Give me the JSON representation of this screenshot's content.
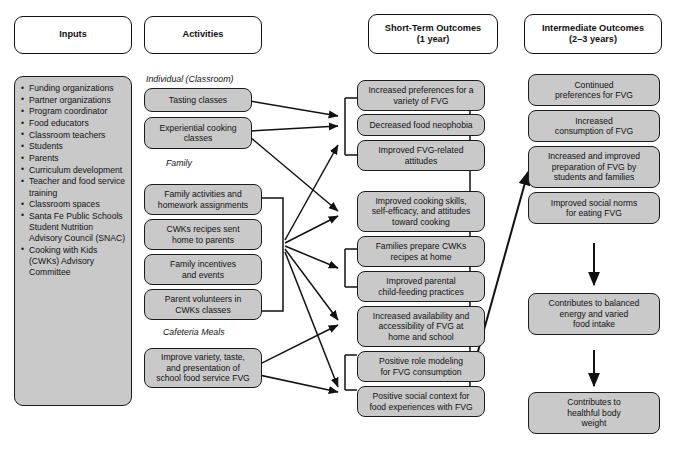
{
  "figure": {
    "type": "logic-model-diagram",
    "caption": ""
  },
  "colors": {
    "box_fill": "#c9c9c9",
    "box_border": "#1b1b1b",
    "header_fill": "#ffffff",
    "arrow": "#111111",
    "page_background": "#ffffff"
  },
  "columns": [
    {
      "key": "inputs",
      "header": "Inputs",
      "header_sub": ""
    },
    {
      "key": "activities",
      "header": "Activities",
      "header_sub": ""
    },
    {
      "key": "short_term",
      "header": "Short-Term Outcomes",
      "header_sub": "(1 year)"
    },
    {
      "key": "intermediate",
      "header": "Intermediate Outcomes",
      "header_sub": "(2–3 years)"
    }
  ],
  "inputs": {
    "items": [
      "Funding organizations",
      "Partner organizations",
      "Program coordinator",
      "Food educators",
      "Classroom teachers",
      "Students",
      "Parents",
      "Curriculum development",
      "Teacher and food service training",
      "Classroom spaces",
      "Santa Fe Public Schools Student Nutrition Advisory Council (SNAC)",
      "Cooking with Kids (CWKs) Advisory Committee"
    ]
  },
  "activities": {
    "groups": [
      {
        "label": "Individual (Classroom)",
        "boxes": [
          "Tasting classes",
          "Experiential cooking\nclasses"
        ]
      },
      {
        "label": "Family",
        "boxes": [
          "Family activities and\nhomework assignments",
          "CWKs recipes sent\nhome to parents",
          "Family incentives\nand events",
          "Parent volunteers in\nCWKs classes"
        ]
      },
      {
        "label": "Cafeteria Meals",
        "boxes": [
          "Improve variety, taste,\nand presentation of\nschool food service FVG"
        ]
      }
    ]
  },
  "short_term": {
    "boxes": [
      "Increased preferences for a\nvariety of FVG",
      "Decreased food neophobia",
      "Improved FVG-related\nattitudes",
      "Improved cooking skills,\nself-efficacy, and attitudes\ntoward cooking",
      "Families prepare CWKs\nrecipes at home",
      "Improved parental\nchild-feeding practices",
      "Increased availability and\naccessibility of FVG at\nhome and school",
      "Positive role modeling\nfor FVG consumption",
      "Positive social context for\nfood experiences with FVG"
    ]
  },
  "intermediate": {
    "boxes": [
      "Continued\npreferences for FVG",
      "Increased\nconsumption of FVG",
      "Increased and improved\npreparation of FVG by\nstudents and families",
      "Improved social norms\nfor eating FVG",
      "Contributes to balanced\nenergy and varied\nfood intake",
      "Contributes to\nhealthful body\nweight"
    ]
  }
}
